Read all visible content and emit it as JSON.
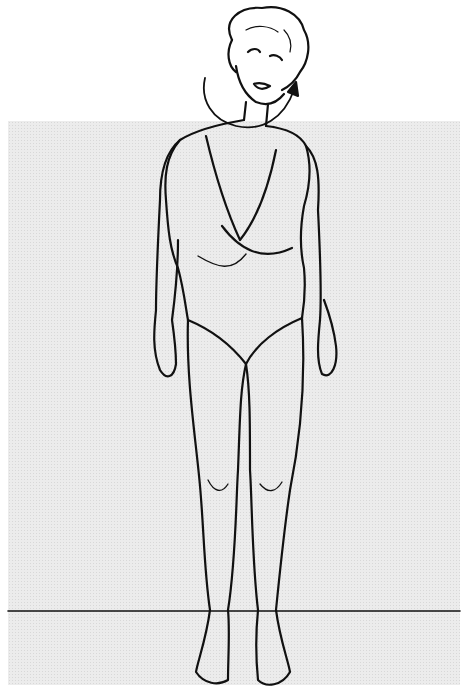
{
  "illustration": {
    "subject": "standing woman in swimsuit performing neck rotation",
    "background_color": "#ececec",
    "line_color": "#111111",
    "arrow": "rotation arrow around head"
  }
}
